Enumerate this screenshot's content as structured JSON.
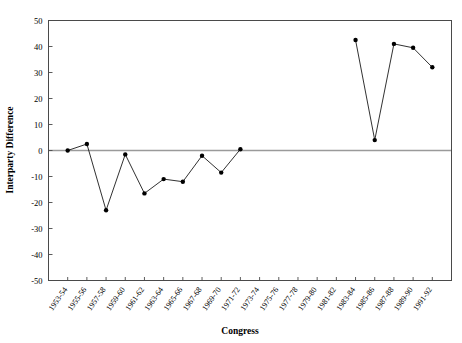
{
  "chart_data": {
    "type": "line",
    "title": "",
    "xlabel": "Congress",
    "ylabel": "Interparty Difference",
    "ylim": [
      -50,
      50
    ],
    "yticks": [
      50,
      40,
      30,
      20,
      10,
      0,
      -10,
      -20,
      -30,
      -40,
      -50
    ],
    "ytick_labels": [
      "50",
      "40",
      "30",
      "20",
      "10",
      "0",
      "-10",
      "-20",
      "-30",
      "-40",
      "-50"
    ],
    "grid": false,
    "legend": null,
    "zero_reference_line": 0,
    "categories": [
      "1953-54",
      "1955-56",
      "1957-58",
      "1959-60",
      "1961-62",
      "1963-64",
      "1965-66",
      "1967-68",
      "1969-70",
      "1971-72",
      "1973-74",
      "1975-76",
      "1977-78",
      "1979-80",
      "1981-82",
      "1983-84",
      "1985-86",
      "1987-88",
      "1989-90",
      "1991-92"
    ],
    "series": [
      {
        "name": "Interparty Difference",
        "values": [
          0,
          2.5,
          -23,
          -1.5,
          -16.5,
          -11,
          -12,
          -2,
          -8.5,
          0.5,
          null,
          null,
          null,
          null,
          null,
          42.5,
          4,
          41,
          39.5,
          32
        ]
      }
    ]
  }
}
